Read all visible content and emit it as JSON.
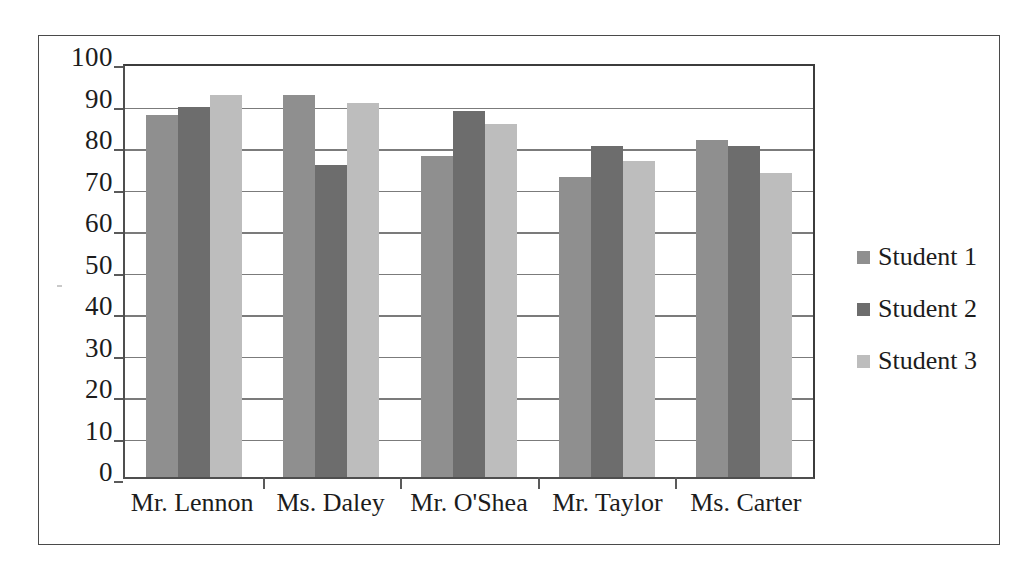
{
  "chart_data": {
    "type": "bar",
    "title": "",
    "xlabel": "",
    "ylabel": "",
    "ylim": [
      0,
      100
    ],
    "ytick_step": 10,
    "yticks": [
      100,
      90,
      80,
      70,
      60,
      50,
      40,
      30,
      20,
      10,
      0
    ],
    "grid": true,
    "legend_position": "right",
    "categories": [
      "Mr. Lennon",
      "Ms. Daley",
      "Mr. O'Shea",
      "Mr. Taylor",
      "Ms. Carter"
    ],
    "series": [
      {
        "name": "Student 1",
        "color": "#8f8f8f",
        "values": [
          88,
          93,
          78,
          73,
          82
        ]
      },
      {
        "name": "Student 2",
        "color": "#6d6d6d",
        "values": [
          90,
          76,
          89,
          80.5,
          80.5
        ]
      },
      {
        "name": "Student 3",
        "color": "#bdbdbd",
        "values": [
          93,
          91,
          86,
          77,
          74
        ]
      }
    ]
  },
  "axis": {
    "y_labels": [
      "100",
      "90",
      "80",
      "70",
      "60",
      "50",
      "40",
      "30",
      "20",
      "10",
      "0"
    ],
    "x_labels": [
      "Mr. Lennon",
      "Ms. Daley",
      "Mr. O'Shea",
      "Mr. Taylor",
      "Ms. Carter"
    ]
  },
  "legend": {
    "items": [
      {
        "label": "Student 1",
        "color": "#8f8f8f"
      },
      {
        "label": "Student 2",
        "color": "#6d6d6d"
      },
      {
        "label": "Student 3",
        "color": "#bdbdbd"
      }
    ]
  },
  "colors": {
    "series_1": "#8f8f8f",
    "series_2": "#6d6d6d",
    "series_3": "#bdbdbd",
    "gridline": "#7b7b7b",
    "axis": "#4f4f4f",
    "frame": "#4a4a4a",
    "text": "#1c1c1c",
    "background": "#ffffff"
  }
}
